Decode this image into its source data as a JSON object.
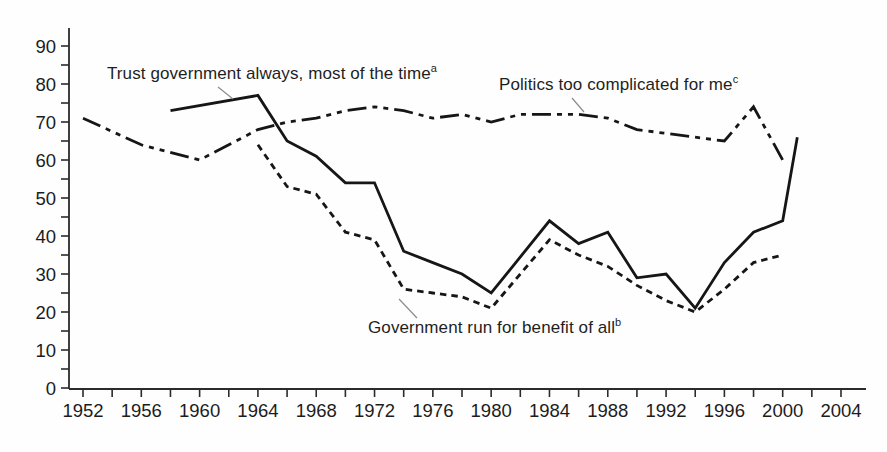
{
  "figure": {
    "background_color": "#fefefe",
    "line_color": "#161616",
    "axis_color": "#2b2b2b",
    "leader_line_color": "#8c8c8c",
    "text_color": "#1f1f1f"
  },
  "chart_data": {
    "type": "line",
    "title": "",
    "xlabel": "",
    "ylabel": "",
    "grid": false,
    "legend": "inline-annotations",
    "x_axis": {
      "min": 1952,
      "max": 2004,
      "minor_tick_step_years": 2,
      "labeled_tick_step_years": 4,
      "tick_labels": [
        "1952",
        "1956",
        "1960",
        "1964",
        "1968",
        "1972",
        "1976",
        "1980",
        "1984",
        "1988",
        "1992",
        "1996",
        "2000",
        "2004"
      ]
    },
    "y_axis": {
      "min": 0,
      "max": 90,
      "minor_tick_step": 5,
      "labeled_tick_step": 10,
      "tick_labels": [
        "0",
        "10",
        "20",
        "30",
        "40",
        "50",
        "60",
        "70",
        "80",
        "90"
      ]
    },
    "series": [
      {
        "name": "trust-government",
        "label": "Trust government always, most of the time",
        "footnote_marker": "a",
        "line_style": "solid",
        "points": [
          [
            1958,
            73
          ],
          [
            1964,
            77
          ],
          [
            1966,
            65
          ],
          [
            1968,
            61
          ],
          [
            1970,
            54
          ],
          [
            1972,
            54
          ],
          [
            1974,
            36
          ],
          [
            1976,
            33
          ],
          [
            1978,
            30
          ],
          [
            1980,
            25
          ],
          [
            1984,
            44
          ],
          [
            1986,
            38
          ],
          [
            1988,
            41
          ],
          [
            1990,
            29
          ],
          [
            1992,
            30
          ],
          [
            1994,
            21
          ],
          [
            1996,
            33
          ],
          [
            1998,
            41
          ],
          [
            2000,
            44
          ],
          [
            2001,
            66
          ]
        ]
      },
      {
        "name": "politics-too-complicated",
        "label": "Politics too complicated for me",
        "footnote_marker": "c",
        "line_style": "dash-dot",
        "points": [
          [
            1952,
            71
          ],
          [
            1956,
            64
          ],
          [
            1960,
            60
          ],
          [
            1964,
            68
          ],
          [
            1966,
            70
          ],
          [
            1968,
            71
          ],
          [
            1970,
            73
          ],
          [
            1972,
            74
          ],
          [
            1974,
            73
          ],
          [
            1976,
            71
          ],
          [
            1978,
            72
          ],
          [
            1980,
            70
          ],
          [
            1982,
            72
          ],
          [
            1984,
            72
          ],
          [
            1986,
            72
          ],
          [
            1988,
            71
          ],
          [
            1990,
            68
          ],
          [
            1992,
            67
          ],
          [
            1994,
            66
          ],
          [
            1996,
            65
          ],
          [
            1998,
            74
          ],
          [
            2000,
            60
          ]
        ]
      },
      {
        "name": "government-benefit-of-all",
        "label": "Government run for benefit of all",
        "footnote_marker": "b",
        "line_style": "dashed",
        "points": [
          [
            1964,
            64
          ],
          [
            1966,
            53
          ],
          [
            1968,
            51
          ],
          [
            1970,
            41
          ],
          [
            1972,
            39
          ],
          [
            1974,
            26
          ],
          [
            1976,
            25
          ],
          [
            1978,
            24
          ],
          [
            1980,
            21
          ],
          [
            1984,
            39
          ],
          [
            1986,
            35
          ],
          [
            1988,
            32
          ],
          [
            1990,
            27
          ],
          [
            1992,
            23
          ],
          [
            1994,
            20
          ],
          [
            1996,
            26
          ],
          [
            1998,
            33
          ],
          [
            2000,
            35
          ]
        ]
      }
    ]
  }
}
